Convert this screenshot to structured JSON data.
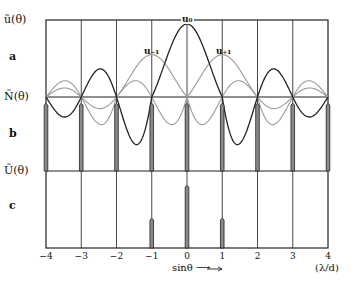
{
  "figure": {
    "panels": [
      {
        "letter": "a",
        "ylabel": "ũ(θ)"
      },
      {
        "letter": "b",
        "ylabel": "Ñ(θ)"
      },
      {
        "letter": "c",
        "ylabel": "Ũ(θ)"
      }
    ],
    "curve_labels": {
      "u0": "u₀",
      "um1": "u₋₁",
      "up1": "u₊₁"
    },
    "x_ticks": [
      "-4",
      "-3",
      "-2",
      "-1",
      "0",
      "1",
      "2",
      "3",
      "4"
    ],
    "xlabel": "sinθ ⟶",
    "x_unit": "(λ/d)"
  },
  "colors": {
    "line": "#222222",
    "gray_curve": "#9a9a9a",
    "spike_fill": "#8a8a8a"
  },
  "chart_data": {
    "type": "line",
    "title": "",
    "xlabel": "sinθ",
    "x_unit": "λ/d",
    "xlim": [
      -4,
      4
    ],
    "x_ticks": [
      -4,
      -3,
      -2,
      -1,
      0,
      1,
      2,
      3,
      4
    ],
    "panels": [
      {
        "id": "a",
        "ylabel": "ũ(θ)",
        "series": [
          {
            "name": "u0",
            "description": "sinc-like envelope centered at 0, zeros at ±1, small side lobes",
            "peak_x": 0,
            "peak": 1.0
          },
          {
            "name": "u-1",
            "description": "sinc-like envelope centered at -1",
            "peak_x": -1,
            "peak": 0.58
          },
          {
            "name": "u+1",
            "description": "sinc-like envelope centered at +1",
            "peak_x": 1,
            "peak": 0.58
          }
        ]
      },
      {
        "id": "b",
        "ylabel": "Ñ(θ)",
        "description": "grating function: narrow equal-height spikes at integer orders",
        "spike_x": [
          -4,
          -3,
          -2,
          -1,
          0,
          1,
          2,
          3,
          4
        ],
        "spike_height": 1.0
      },
      {
        "id": "c",
        "ylabel": "Ũ(θ)",
        "description": "product spectrum: spikes at -1, 0, +1",
        "spike_x": [
          -1,
          0,
          1
        ],
        "spike_height": [
          0.43,
          0.9,
          0.43
        ]
      }
    ]
  }
}
